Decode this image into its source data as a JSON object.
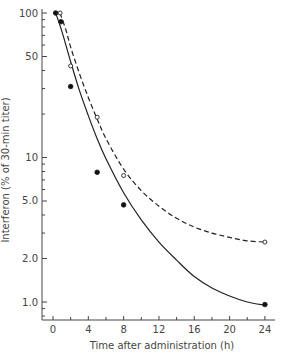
{
  "chart_data": {
    "type": "line",
    "title": "",
    "xlabel": "Time after administration (h)",
    "ylabel": "Interferon (% of 30-min titer)",
    "xscale": "linear",
    "yscale": "log",
    "xlim": [
      -1,
      26
    ],
    "ylim": [
      0.8,
      100
    ],
    "xticks": [
      0,
      4,
      8,
      12,
      16,
      20,
      24
    ],
    "xtick_labels": [
      "0",
      "4",
      "8",
      "12",
      "16",
      "20",
      "24"
    ],
    "yticks": [
      1.0,
      2.0,
      5.0,
      10,
      50,
      100
    ],
    "ytick_labels": [
      "1.0",
      "2.0",
      "5.0",
      "10",
      "50",
      "100"
    ],
    "grid": false,
    "legend": null,
    "series": [
      {
        "name": "filled circles (solid line)",
        "marker": "filled-circle",
        "line": "solid",
        "x": [
          0.3,
          0.9,
          2,
          5,
          8,
          24
        ],
        "y": [
          100,
          87,
          31,
          7.9,
          4.7,
          0.96
        ]
      },
      {
        "name": "open circles (dashed line)",
        "marker": "open-circle",
        "line": "dashed",
        "x": [
          0.8,
          2,
          5,
          8,
          24
        ],
        "y": [
          100,
          43,
          19,
          7.5,
          2.6
        ]
      }
    ],
    "curves": [
      {
        "name": "solid fit",
        "x": [
          0.3,
          1,
          2,
          3,
          4,
          5,
          6,
          8,
          10,
          12,
          14,
          16,
          18,
          20,
          22,
          24
        ],
        "y": [
          100,
          75,
          46,
          29,
          19.5,
          13.5,
          9.8,
          5.7,
          3.7,
          2.6,
          1.95,
          1.5,
          1.25,
          1.1,
          1.0,
          0.95
        ]
      },
      {
        "name": "dashed fit",
        "x": [
          0.8,
          1.5,
          2,
          3,
          4,
          5,
          6,
          8,
          10,
          12,
          14,
          16,
          18,
          20,
          22,
          24
        ],
        "y": [
          100,
          75,
          58,
          38,
          26,
          18.5,
          13.5,
          8.3,
          5.9,
          4.6,
          3.8,
          3.3,
          3.0,
          2.8,
          2.65,
          2.6
        ]
      }
    ]
  },
  "axes": {
    "xlabel": "Time after administration (h)",
    "ylabel": "Interferon (% of 30-min titer)"
  }
}
